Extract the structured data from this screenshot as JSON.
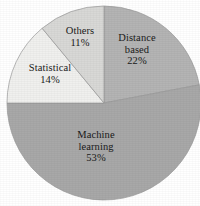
{
  "chart_data": {
    "type": "pie",
    "title": "",
    "subtitle": "",
    "xlabel": "",
    "ylabel": "",
    "legend_position": "none",
    "grid": false,
    "labels_inside_slices": true,
    "start_angle_deg": 0,
    "direction": "clockwise",
    "categories": [
      "Distance based",
      "Machine learning",
      "Statistical",
      "Others"
    ],
    "values": [
      22,
      53,
      14,
      11
    ],
    "unit": "%",
    "slices": [
      {
        "name": "Distance based",
        "label_line1": "Distance",
        "label_line2": "based",
        "value": 22,
        "value_text": "22%",
        "color": "#b4b4b4"
      },
      {
        "name": "Machine learning",
        "label_line1": "Machine",
        "label_line2": "learning",
        "value": 53,
        "value_text": "53%",
        "color": "#a8a8a8"
      },
      {
        "name": "Statistical",
        "label_line1": "Statistical",
        "label_line2": "",
        "value": 14,
        "value_text": "14%",
        "color": "#f0f0ee"
      },
      {
        "name": "Others",
        "label_line1": "Others",
        "label_line2": "",
        "value": 11,
        "value_text": "11%",
        "color": "#d8d8d6"
      }
    ]
  },
  "figure": {
    "background_color": "#ffffff",
    "slice_outline_color": "#9a9a9a",
    "label_text_color": "#1a1a1a"
  }
}
